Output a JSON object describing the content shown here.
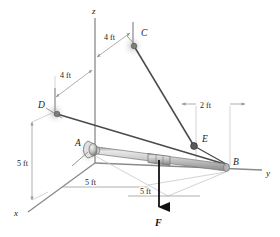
{
  "figure": {
    "background": "#ffffff"
  },
  "colors": {
    "axis": "#8a8a8a",
    "cable": "#4a4a4a",
    "dimension": "#9a9a9a",
    "rod_light": "#d8d8d8",
    "rod_mid": "#b0b0b0",
    "rod_dark": "#8f8f8f",
    "force": "#111111",
    "text": "#1a1a1a",
    "support": "#7d7d7d"
  },
  "axes": [
    {
      "name": "z-axis",
      "label": "z"
    },
    {
      "name": "y-axis",
      "label": "y"
    },
    {
      "name": "x-axis",
      "label": "x"
    }
  ],
  "points": [
    {
      "id": "A",
      "label": "A",
      "kind": "ball-and-socket-joint"
    },
    {
      "id": "B",
      "label": "B",
      "kind": "rod-end"
    },
    {
      "id": "C",
      "label": "C",
      "kind": "cable-anchor"
    },
    {
      "id": "D",
      "label": "D",
      "kind": "cable-anchor"
    },
    {
      "id": "E",
      "label": "E",
      "kind": "cable-attachment-collar"
    }
  ],
  "dimensions": [
    {
      "id": "dim-z-to-c",
      "label": "4 ft"
    },
    {
      "id": "dim-d-to-z",
      "label": "4 ft"
    },
    {
      "id": "dim-e-to-b",
      "label": "2 ft"
    },
    {
      "id": "dim-d-height",
      "label": "5 ft"
    },
    {
      "id": "dim-a-to-mid",
      "label": "5 ft"
    },
    {
      "id": "dim-mid-to-b",
      "label": "5 ft"
    }
  ],
  "force": {
    "label": "F",
    "direction": "downward"
  }
}
